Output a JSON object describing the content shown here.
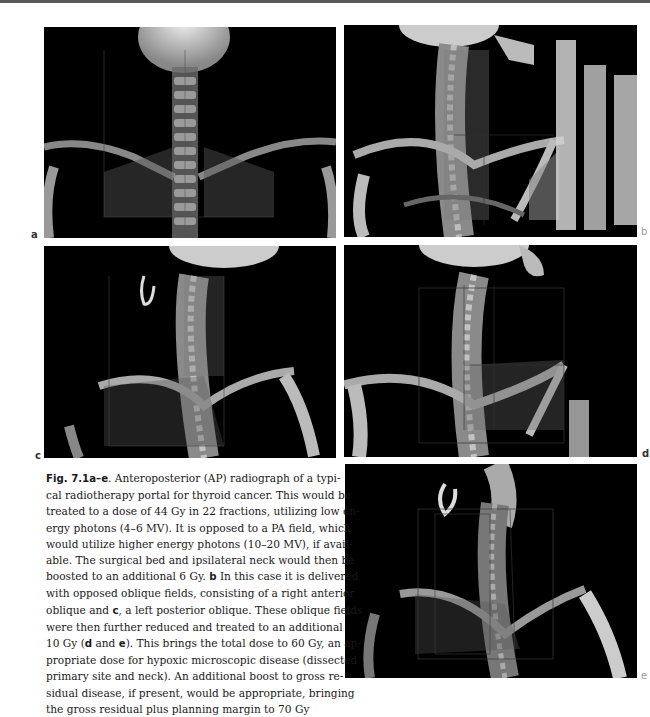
{
  "figure": {
    "id": "Fig. 7.1a–e",
    "panels": [
      {
        "label": "a",
        "description": "Anteroposterior (AP) radiograph portal"
      },
      {
        "label": "b",
        "description": "Right anterior oblique field"
      },
      {
        "label": "c",
        "description": "Left posterior oblique field"
      },
      {
        "label": "d",
        "description": "Reduced oblique field"
      },
      {
        "label": "e",
        "description": "Reduced oblique field"
      }
    ],
    "caption": {
      "lines": [
        {
          "parts": [
            {
              "b": "Fig. 7.1a–e"
            },
            {
              "t": ". Anteroposterior (AP) radiograph of a typi-"
            }
          ]
        },
        {
          "parts": [
            {
              "t": "cal radiotherapy portal for thyroid cancer. This would be"
            }
          ]
        },
        {
          "parts": [
            {
              "t": "treated to a dose of 44 Gy in 22 fractions, utilizing low en-"
            }
          ]
        },
        {
          "parts": [
            {
              "t": "ergy photons (4–6 MV). It is opposed to a PA field, which"
            }
          ]
        },
        {
          "parts": [
            {
              "t": "would utilize higher energy photons (10–20 MV), if avail-"
            }
          ]
        },
        {
          "parts": [
            {
              "t": "able. The surgical bed and ipsilateral neck would then be"
            }
          ]
        },
        {
          "parts": [
            {
              "t": "boosted to an additional 6 Gy. "
            },
            {
              "b": "b"
            },
            {
              "t": " In this case it is delivered"
            }
          ]
        },
        {
          "parts": [
            {
              "t": "with opposed oblique fields, consisting of a right anterior"
            }
          ]
        },
        {
          "parts": [
            {
              "t": "oblique and "
            },
            {
              "b": "c"
            },
            {
              "t": ", a left posterior oblique. These oblique fields"
            }
          ]
        },
        {
          "parts": [
            {
              "t": "were then further reduced and treated to an additional"
            }
          ]
        },
        {
          "parts": [
            {
              "t": "10 Gy ("
            },
            {
              "b": "d"
            },
            {
              "t": " and "
            },
            {
              "b": "e"
            },
            {
              "t": "). This brings the total dose to 60 Gy, an ap-"
            }
          ]
        },
        {
          "parts": [
            {
              "t": "propriate dose for hypoxic microscopic disease (dissected"
            }
          ]
        },
        {
          "parts": [
            {
              "t": "primary site and neck). An additional boost to gross re-"
            }
          ]
        },
        {
          "parts": [
            {
              "t": "sidual disease, if present, would be appropriate, bringing"
            }
          ]
        },
        {
          "parts": [
            {
              "t": "the gross residual plus planning margin to 70 Gy"
            }
          ]
        }
      ]
    }
  },
  "colors": {
    "page_background": "#ffffff",
    "panel_background": "#000000",
    "bone": "#d8d8d8",
    "text": "#1a1a1a"
  }
}
